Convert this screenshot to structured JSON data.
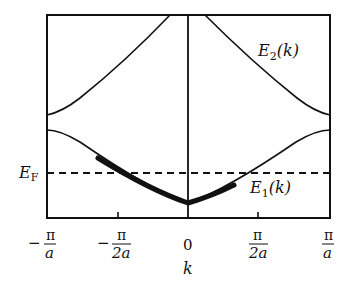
{
  "diagram": {
    "type": "band-structure",
    "x_axis_label": "k",
    "x_ticks": [
      {
        "num": "π",
        "den": "a",
        "sign": "−",
        "value": "-pi/a"
      },
      {
        "num": "π",
        "den": "2a",
        "sign": "−",
        "value": "-pi/2a"
      },
      {
        "num": "0",
        "den": "",
        "sign": "",
        "value": "0"
      },
      {
        "num": "π",
        "den": "2a",
        "sign": "",
        "value": "pi/2a"
      },
      {
        "num": "π",
        "den": "a",
        "sign": "",
        "value": "pi/a"
      }
    ],
    "fermi_label": {
      "main": "E",
      "sub": "F"
    },
    "bands": [
      {
        "name": "E2(k)",
        "main": "E",
        "sub": "2",
        "arg": "(k)"
      },
      {
        "name": "E1(k)",
        "main": "E",
        "sub": "1",
        "arg": "(k)"
      }
    ],
    "colors": {
      "line": "#111111",
      "background": "#ffffff"
    }
  }
}
